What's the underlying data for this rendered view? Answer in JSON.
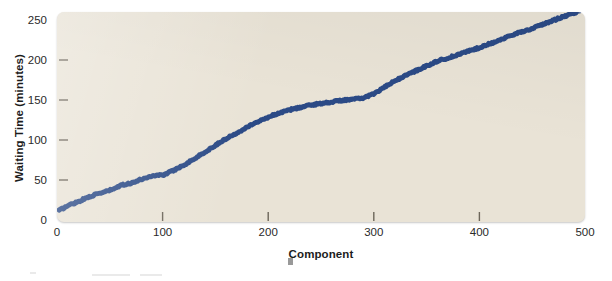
{
  "chart_data": {
    "type": "line",
    "title": "",
    "xlabel": "Component",
    "ylabel": "Waiting Time (minutes)",
    "xlim": [
      0,
      500
    ],
    "ylim": [
      0,
      250
    ],
    "xticks": [
      0,
      100,
      200,
      300,
      400,
      500
    ],
    "yticks": [
      0,
      50,
      100,
      150,
      200,
      250
    ],
    "grid": false,
    "legend": null,
    "line_color": "#2b4a86",
    "plot_background": "#e9e3d6",
    "line_width_px": 5,
    "series": [
      {
        "name": "Waiting Time",
        "x": [
          0,
          10,
          20,
          30,
          40,
          50,
          60,
          70,
          80,
          90,
          100,
          110,
          120,
          130,
          140,
          150,
          160,
          170,
          180,
          190,
          200,
          210,
          220,
          230,
          240,
          250,
          260,
          270,
          280,
          290,
          300,
          310,
          320,
          330,
          340,
          350,
          360,
          370,
          380,
          390,
          400,
          410,
          420,
          430,
          440,
          450,
          460,
          470,
          480,
          490,
          500
        ],
        "values": [
          2,
          9,
          14,
          20,
          24,
          28,
          34,
          37,
          42,
          46,
          47,
          53,
          60,
          68,
          76,
          85,
          93,
          100,
          108,
          114,
          120,
          125,
          129,
          132,
          135,
          137,
          139,
          141,
          142,
          144,
          149,
          157,
          165,
          172,
          178,
          184,
          190,
          194,
          198,
          203,
          207,
          212,
          217,
          222,
          227,
          231,
          236,
          241,
          246,
          251,
          255
        ]
      }
    ]
  },
  "axis": {
    "y_tick_labels": [
      "250",
      "200",
      "150",
      "100",
      "50",
      "0"
    ],
    "x_tick_labels": [
      "0",
      "100",
      "200",
      "300",
      "400",
      "500"
    ]
  }
}
